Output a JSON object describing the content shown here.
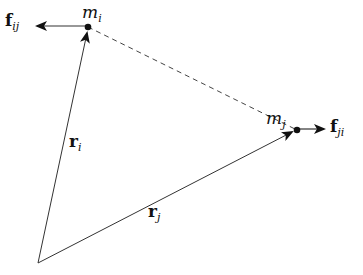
{
  "diagram": {
    "type": "two-body force diagram",
    "colors": {
      "stroke": "#333333",
      "background": "#ffffff"
    },
    "points": {
      "origin": {
        "x": 38,
        "y": 263
      },
      "mass_i": {
        "x": 88,
        "y": 27
      },
      "mass_j": {
        "x": 297,
        "y": 130
      }
    },
    "labels": {
      "m_i": {
        "base": "m",
        "sub": "i"
      },
      "m_j": {
        "base": "m",
        "sub": "j"
      },
      "r_i": {
        "base": "r",
        "sub": "i"
      },
      "r_j": {
        "base": "r",
        "sub": "j"
      },
      "f_ij": {
        "base": "f",
        "sub": "ij"
      },
      "f_ji": {
        "base": "f",
        "sub": "ji"
      }
    },
    "edges": [
      {
        "name": "r_i",
        "from": "origin",
        "to": "mass_i",
        "style": "solid-arrow"
      },
      {
        "name": "r_j",
        "from": "origin",
        "to": "mass_j",
        "style": "solid-arrow"
      },
      {
        "name": "separation",
        "from": "mass_i",
        "to": "mass_j",
        "style": "dashed"
      },
      {
        "name": "f_ij",
        "from": "mass_i",
        "direction": "left",
        "style": "solid-arrow"
      },
      {
        "name": "f_ji",
        "from": "mass_j",
        "direction": "right",
        "style": "solid-arrow"
      }
    ]
  }
}
